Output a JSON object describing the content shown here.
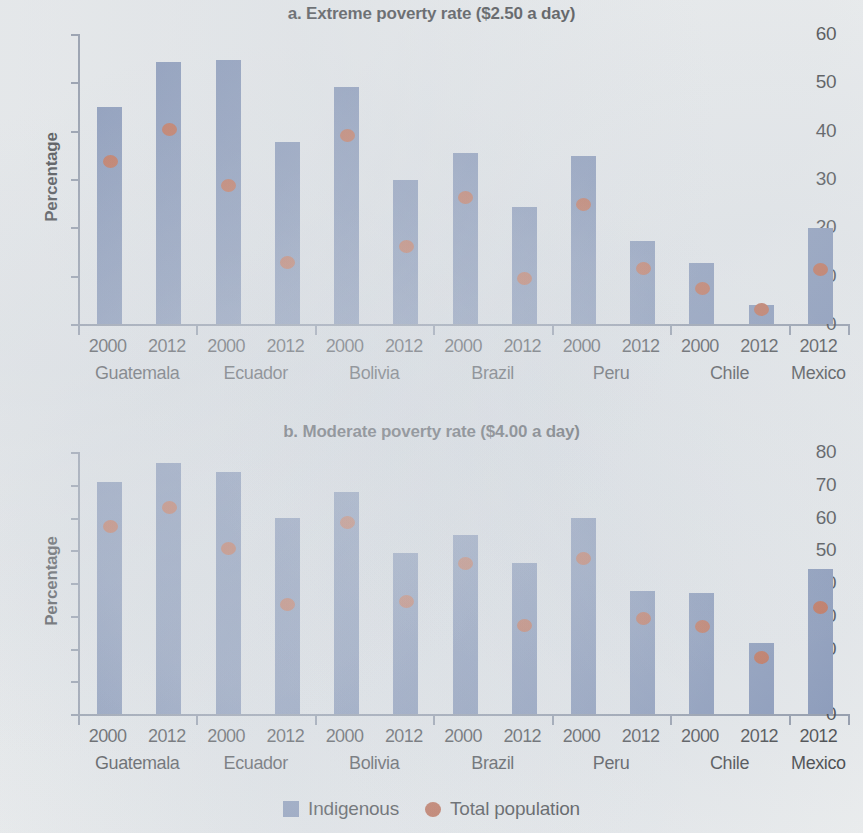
{
  "legend": {
    "items": [
      {
        "label": "Indigenous",
        "marker": "square-swatch-icon",
        "color": "#6b7faa"
      },
      {
        "label": "Total population",
        "marker": "circle-swatch-icon",
        "color": "#b8461f"
      }
    ]
  },
  "colors": {
    "bar": "#6b7faa",
    "dot": "#b8461f",
    "axis": "#7b8496",
    "background": "#f2f3f2",
    "text": "#111111"
  },
  "chart_data": [
    {
      "id": "panel-a",
      "type": "bar",
      "title": "a. Extreme poverty rate ($2.50 a day)",
      "xlabel": "",
      "ylabel": "Percentage",
      "ylim": [
        0,
        60
      ],
      "yticks": [
        0,
        10,
        20,
        30,
        40,
        50,
        60
      ],
      "ytick_labels": [
        "0",
        "10",
        "20",
        "30",
        "40",
        "50",
        "60"
      ],
      "grid": false,
      "legend_position": "bottom",
      "categories": [
        {
          "country": "Guatemala",
          "year": "2000"
        },
        {
          "country": "Guatemala",
          "year": "2012"
        },
        {
          "country": "Ecuador",
          "year": "2000"
        },
        {
          "country": "Ecuador",
          "year": "2012"
        },
        {
          "country": "Bolivia",
          "year": "2000"
        },
        {
          "country": "Bolivia",
          "year": "2012"
        },
        {
          "country": "Brazil",
          "year": "2000"
        },
        {
          "country": "Brazil",
          "year": "2012"
        },
        {
          "country": "Peru",
          "year": "2000"
        },
        {
          "country": "Peru",
          "year": "2012"
        },
        {
          "country": "Chile",
          "year": "2000"
        },
        {
          "country": "Chile",
          "year": "2012"
        },
        {
          "country": "Mexico",
          "year": "2012"
        }
      ],
      "countries": [
        "Guatemala",
        "Ecuador",
        "Bolivia",
        "Brazil",
        "Peru",
        "Chile",
        "Mexico"
      ],
      "years": [
        "2000",
        "2012",
        "2000",
        "2012",
        "2000",
        "2012",
        "2000",
        "2012",
        "2000",
        "2012",
        "2000",
        "2012",
        "2012"
      ],
      "series": [
        {
          "name": "Indigenous",
          "marker": "bar",
          "color": "#6b7faa",
          "values": [
            45.0,
            54.3,
            54.6,
            37.6,
            49.0,
            29.8,
            35.4,
            24.2,
            34.8,
            17.2,
            12.6,
            4.0,
            19.9
          ]
        },
        {
          "name": "Total population",
          "marker": "dot",
          "color": "#b8461f",
          "values": [
            33.6,
            40.2,
            28.6,
            12.7,
            39.0,
            16.0,
            26.0,
            9.4,
            24.7,
            11.3,
            7.2,
            2.9,
            11.1
          ]
        }
      ]
    },
    {
      "id": "panel-b",
      "type": "bar",
      "title": "b. Moderate poverty rate ($4.00 a day)",
      "xlabel": "",
      "ylabel": "Percentage",
      "ylim": [
        0,
        80
      ],
      "yticks": [
        0,
        10,
        20,
        30,
        40,
        50,
        60,
        70,
        80
      ],
      "ytick_labels": [
        "0",
        "",
        "20",
        "30",
        "40",
        "50",
        "60",
        "70",
        "80"
      ],
      "grid": false,
      "legend_position": "bottom",
      "categories": [
        {
          "country": "Guatemala",
          "year": "2000"
        },
        {
          "country": "Guatemala",
          "year": "2012"
        },
        {
          "country": "Ecuador",
          "year": "2000"
        },
        {
          "country": "Ecuador",
          "year": "2012"
        },
        {
          "country": "Bolivia",
          "year": "2000"
        },
        {
          "country": "Bolivia",
          "year": "2012"
        },
        {
          "country": "Brazil",
          "year": "2000"
        },
        {
          "country": "Brazil",
          "year": "2012"
        },
        {
          "country": "Peru",
          "year": "2000"
        },
        {
          "country": "Peru",
          "year": "2012"
        },
        {
          "country": "Chile",
          "year": "2000"
        },
        {
          "country": "Chile",
          "year": "2012"
        },
        {
          "country": "Mexico",
          "year": "2012"
        }
      ],
      "countries": [
        "Guatemala",
        "Ecuador",
        "Bolivia",
        "Brazil",
        "Peru",
        "Chile",
        "Mexico"
      ],
      "years": [
        "2000",
        "2012",
        "2000",
        "2012",
        "2000",
        "2012",
        "2000",
        "2012",
        "2000",
        "2012",
        "2000",
        "2012",
        "2012"
      ],
      "series": [
        {
          "name": "Indigenous",
          "marker": "bar",
          "color": "#6b7faa",
          "values": [
            70.8,
            76.7,
            73.9,
            59.8,
            67.8,
            49.2,
            54.7,
            46.0,
            59.9,
            37.6,
            37.0,
            21.6,
            44.4
          ]
        },
        {
          "name": "Total population",
          "marker": "dot",
          "color": "#b8461f",
          "values": [
            57.0,
            63.0,
            50.5,
            33.2,
            58.4,
            34.3,
            45.7,
            27.0,
            47.2,
            29.0,
            26.5,
            17.2,
            32.3
          ]
        }
      ]
    }
  ]
}
